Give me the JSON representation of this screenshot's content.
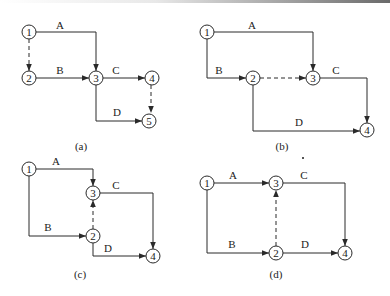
{
  "figure": {
    "panels": [
      {
        "caption": "(a)",
        "nodes": [
          "1",
          "2",
          "3",
          "4",
          "5"
        ],
        "activities": [
          {
            "label": "A",
            "from": "1",
            "to": "3",
            "type": "real"
          },
          {
            "label": "B",
            "from": "2",
            "to": "3",
            "type": "real"
          },
          {
            "label": "C",
            "from": "3",
            "to": "4",
            "type": "real"
          },
          {
            "label": "D",
            "from": "3",
            "to": "5",
            "type": "real"
          },
          {
            "label": "",
            "from": "1",
            "to": "2",
            "type": "dummy"
          },
          {
            "label": "",
            "from": "4",
            "to": "5",
            "type": "dummy"
          }
        ]
      },
      {
        "caption": "(b)",
        "nodes": [
          "1",
          "2",
          "3",
          "4"
        ],
        "activities": [
          {
            "label": "A",
            "from": "1",
            "to": "3",
            "type": "real"
          },
          {
            "label": "B",
            "from": "1",
            "to": "2",
            "type": "real"
          },
          {
            "label": "C",
            "from": "3",
            "to": "4",
            "type": "real"
          },
          {
            "label": "D",
            "from": "2",
            "to": "4",
            "type": "real"
          },
          {
            "label": "",
            "from": "2",
            "to": "3",
            "type": "dummy"
          }
        ]
      },
      {
        "caption": "(c)",
        "nodes": [
          "1",
          "2",
          "3",
          "4"
        ],
        "activities": [
          {
            "label": "A",
            "from": "1",
            "to": "3",
            "type": "real"
          },
          {
            "label": "B",
            "from": "1",
            "to": "2",
            "type": "real"
          },
          {
            "label": "C",
            "from": "3",
            "to": "4",
            "type": "real"
          },
          {
            "label": "D",
            "from": "2",
            "to": "4",
            "type": "real"
          },
          {
            "label": "",
            "from": "2",
            "to": "3",
            "type": "dummy"
          }
        ]
      },
      {
        "caption": "(d)",
        "nodes": [
          "1",
          "2",
          "3",
          "4"
        ],
        "activities": [
          {
            "label": "A",
            "from": "1",
            "to": "3",
            "type": "real"
          },
          {
            "label": "B",
            "from": "1",
            "to": "2",
            "type": "real"
          },
          {
            "label": "C",
            "from": "3",
            "to": "4",
            "type": "real"
          },
          {
            "label": "D",
            "from": "2",
            "to": "4",
            "type": "real"
          },
          {
            "label": "",
            "from": "2",
            "to": "3",
            "type": "dummy"
          }
        ]
      }
    ],
    "colors": {
      "line": "#2a2a2a",
      "background": "#ffffff"
    }
  }
}
